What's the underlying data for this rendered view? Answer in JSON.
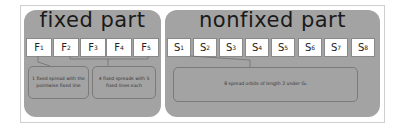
{
  "fixed_part": {
    "title": "fixed part",
    "boxes": [
      {
        "letter": "F",
        "index": "1"
      },
      {
        "letter": "F",
        "index": "2"
      },
      {
        "letter": "F",
        "index": "3"
      },
      {
        "letter": "F",
        "index": "4"
      },
      {
        "letter": "F",
        "index": "5"
      }
    ],
    "callouts": [
      {
        "text": "1 fixed spread with the pointwise fixed line"
      },
      {
        "text": "4 fixed spreads with 5 fixed lines each"
      }
    ]
  },
  "nonfixed_part": {
    "title": "nonfixed part",
    "boxes": [
      {
        "letter": "S",
        "index": "1"
      },
      {
        "letter": "S",
        "index": "2"
      },
      {
        "letter": "S",
        "index": "3"
      },
      {
        "letter": "S",
        "index": "4"
      },
      {
        "letter": "S",
        "index": "5"
      },
      {
        "letter": "S",
        "index": "6"
      },
      {
        "letter": "S",
        "index": "7"
      },
      {
        "letter": "S",
        "index": "8"
      }
    ],
    "callouts": [
      {
        "text": "8 spread orbits of length 2 under G₁"
      }
    ]
  }
}
